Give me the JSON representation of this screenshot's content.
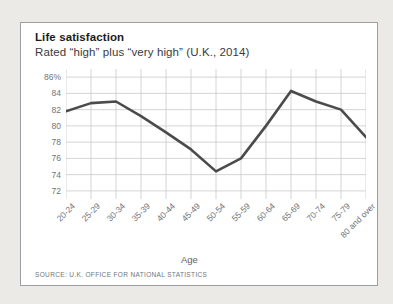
{
  "card": {
    "title": "Life satisfaction",
    "subtitle": "Rated “high” plus “very high” (U.K., 2014)",
    "source": "SOURCE: U.K. OFFICE FOR NATIONAL STATISTICS"
  },
  "colors": {
    "line": "#4b4b4b",
    "grid": "#c9c9c9",
    "axis_text": "#6f7478",
    "title_text": "#1b1b1b",
    "card_background": "#ffffff",
    "page_background": "#eceae6",
    "card_border": "#9aa0a3"
  },
  "chart_data": {
    "type": "line",
    "title": "Life satisfaction",
    "subtitle": "Rated “high” plus “very high” (U.K., 2014)",
    "xlabel": "Age",
    "ylabel": "",
    "ylim": [
      71,
      87
    ],
    "ytick_values": [
      86,
      84,
      82,
      80,
      78,
      76,
      74,
      72
    ],
    "ytick_labels": [
      "86%",
      "84",
      "82",
      "80",
      "78",
      "76",
      "74",
      "72"
    ],
    "grid": true,
    "legend": "none",
    "categories": [
      "20-24",
      "25-29",
      "30-34",
      "35-39",
      "40-44",
      "45-49",
      "50-54",
      "55-59",
      "60-64",
      "65-69",
      "70-74",
      "75-79",
      "80 and over"
    ],
    "values": [
      81.8,
      82.8,
      83.0,
      81.2,
      79.2,
      77.1,
      74.4,
      76.0,
      80.0,
      84.3,
      83.0,
      82.0,
      78.6
    ],
    "series": [
      {
        "name": "Life satisfaction",
        "values": [
          81.8,
          82.8,
          83.0,
          81.2,
          79.2,
          77.1,
          74.4,
          76.0,
          80.0,
          84.3,
          83.0,
          82.0,
          78.6
        ]
      }
    ]
  }
}
